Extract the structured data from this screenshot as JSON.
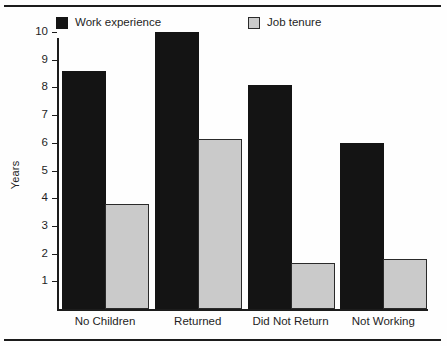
{
  "figure": {
    "title_remnant": "",
    "background_color": "#fefefe"
  },
  "chart_data": {
    "type": "bar",
    "title": "",
    "subtitle": "",
    "xlabel": "",
    "ylabel": "Years",
    "ylim": [
      0,
      10
    ],
    "ytick_values": [
      1,
      2,
      3,
      4,
      5,
      6,
      7,
      8,
      9,
      10
    ],
    "ytick_labels": [
      "1",
      "2",
      "3",
      "4",
      "5",
      "6",
      "7",
      "8",
      "9",
      "10"
    ],
    "grid": false,
    "legend_position": "top",
    "categories": [
      "No Children",
      "Returned",
      "Did Not Return",
      "Not Working"
    ],
    "series": [
      {
        "name": "Work experience",
        "color": "#141414",
        "values": [
          8.6,
          10.0,
          8.1,
          6.0
        ]
      },
      {
        "name": "Job tenure",
        "color": "#cacaca",
        "values": [
          3.8,
          6.15,
          1.65,
          1.8
        ]
      }
    ]
  }
}
